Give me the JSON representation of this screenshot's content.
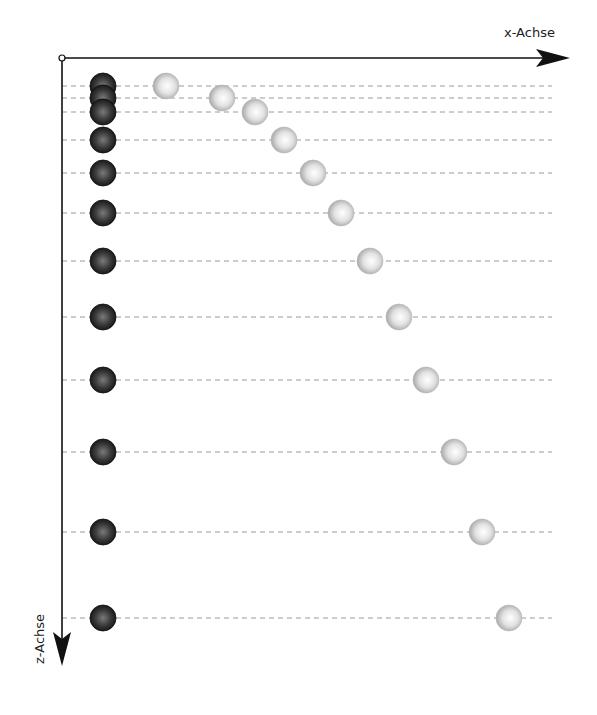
{
  "diagram": {
    "x_axis_label": "x-Achse",
    "z_axis_label": "z-Achse",
    "colors": {
      "axis": "#111111",
      "gridline": "#9a9a9a",
      "dark_ball": "#2a2a2a",
      "light_ball": "#d8d8d8",
      "background": "#ffffff"
    },
    "origin": {
      "x": 62,
      "y": 58
    },
    "gridline_end_x": 552,
    "rows": [
      {
        "z": 86,
        "dark_x": 103,
        "light_x": 166
      },
      {
        "z": 98,
        "dark_x": 103,
        "light_x": 222
      },
      {
        "z": 112,
        "dark_x": 103,
        "light_x": 255
      },
      {
        "z": 140,
        "dark_x": 103,
        "light_x": 284
      },
      {
        "z": 173,
        "dark_x": 103,
        "light_x": 313
      },
      {
        "z": 213,
        "dark_x": 103,
        "light_x": 341
      },
      {
        "z": 261,
        "dark_x": 103,
        "light_x": 370
      },
      {
        "z": 317,
        "dark_x": 103,
        "light_x": 399
      },
      {
        "z": 380,
        "dark_x": 103,
        "light_x": 426
      },
      {
        "z": 452,
        "dark_x": 103,
        "light_x": 454
      },
      {
        "z": 532,
        "dark_x": 103,
        "light_x": 482
      },
      {
        "z": 618,
        "dark_x": 103,
        "light_x": 509
      }
    ],
    "ball_radius": 13
  }
}
